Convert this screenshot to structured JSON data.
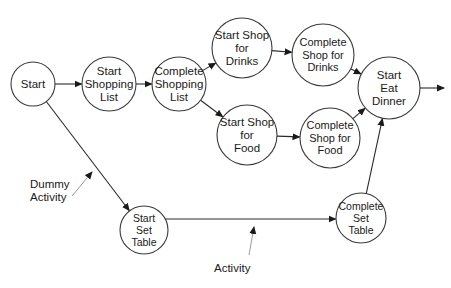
{
  "diagram": {
    "type": "activity-on-arrow network",
    "colors": {
      "node_stroke": "#3a3a3a",
      "edge": "#2a2a2a",
      "annotation": "#9a9a9a",
      "text": "#1a1a1a"
    },
    "nodes": [
      {
        "id": "start",
        "lines": [
          "Start"
        ]
      },
      {
        "id": "start-shopping-list",
        "lines": [
          "Start",
          "Shopping",
          "List"
        ]
      },
      {
        "id": "complete-shopping-list",
        "lines": [
          "Complete",
          "Shopping",
          "List"
        ]
      },
      {
        "id": "start-shop-drinks",
        "lines": [
          "Start Shop",
          "for",
          "Drinks"
        ]
      },
      {
        "id": "complete-shop-drinks",
        "lines": [
          "Complete",
          "Shop for",
          "Drinks"
        ]
      },
      {
        "id": "start-shop-food",
        "lines": [
          "Start Shop",
          "for",
          "Food"
        ]
      },
      {
        "id": "complete-shop-food",
        "lines": [
          "Complete",
          "Shop for",
          "Food"
        ]
      },
      {
        "id": "start-eat-dinner",
        "lines": [
          "Start",
          "Eat",
          "Dinner"
        ]
      },
      {
        "id": "start-set-table",
        "lines": [
          "Start",
          "Set",
          "Table"
        ]
      },
      {
        "id": "complete-set-table",
        "lines": [
          "Complete",
          "Set",
          "Table"
        ]
      }
    ],
    "edges": [
      {
        "from": "start",
        "to": "start-shopping-list"
      },
      {
        "from": "start-shopping-list",
        "to": "complete-shopping-list"
      },
      {
        "from": "complete-shopping-list",
        "to": "start-shop-drinks"
      },
      {
        "from": "complete-shopping-list",
        "to": "start-shop-food"
      },
      {
        "from": "start-shop-drinks",
        "to": "complete-shop-drinks"
      },
      {
        "from": "start-shop-food",
        "to": "complete-shop-food"
      },
      {
        "from": "complete-shop-drinks",
        "to": "start-eat-dinner"
      },
      {
        "from": "complete-shop-food",
        "to": "start-eat-dinner"
      },
      {
        "from": "start",
        "to": "start-set-table"
      },
      {
        "from": "start-set-table",
        "to": "complete-set-table"
      },
      {
        "from": "complete-set-table",
        "to": "start-eat-dinner"
      },
      {
        "from": "start-eat-dinner",
        "to": null
      }
    ],
    "annotations": [
      {
        "id": "dummy-activity",
        "lines": [
          "Dummy",
          "Activity"
        ],
        "points_to": "start -> start-set-table"
      },
      {
        "id": "activity",
        "lines": [
          "Activity"
        ],
        "points_to": "start-set-table -> complete-set-table"
      }
    ]
  }
}
